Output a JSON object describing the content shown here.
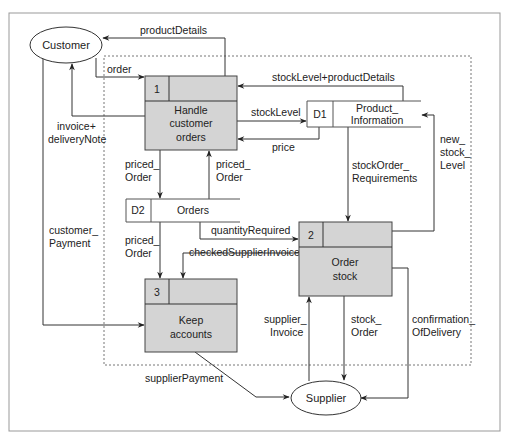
{
  "diagram": {
    "external_entities": [
      {
        "id": "customer",
        "label": "Customer"
      },
      {
        "id": "supplier",
        "label": "Supplier"
      }
    ],
    "processes": [
      {
        "id": "1",
        "number": "1",
        "label_lines": [
          "Handle",
          "customer",
          "orders"
        ]
      },
      {
        "id": "2",
        "number": "2",
        "label_lines": [
          "Order",
          "stock"
        ]
      },
      {
        "id": "3",
        "number": "3",
        "label_lines": [
          "Keep",
          "accounts"
        ]
      }
    ],
    "data_stores": [
      {
        "id": "D1",
        "code": "D1",
        "label_lines": [
          "Product_",
          "Information"
        ]
      },
      {
        "id": "D2",
        "code": "D2",
        "label_lines": [
          "Orders"
        ]
      }
    ],
    "flows": {
      "productDetails": {
        "lines": [
          "productDetails"
        ],
        "from": "1",
        "to": "customer"
      },
      "order": {
        "lines": [
          "order"
        ],
        "from": "customer",
        "to": "1"
      },
      "invoice_deliveryNote": {
        "lines": [
          "invoice+",
          "deliveryNote"
        ],
        "from": "1",
        "to": "customer"
      },
      "customer_Payment": {
        "lines": [
          "customer_",
          "Payment"
        ],
        "from": "customer",
        "to": "3"
      },
      "stockLevel_productDetails": {
        "lines": [
          "stockLevel+productDetails"
        ],
        "from": "D1",
        "to": "1"
      },
      "stockLevel": {
        "lines": [
          "stockLevel"
        ],
        "from": "1",
        "to": "D1"
      },
      "price": {
        "lines": [
          "price"
        ],
        "from": "D1",
        "to": "1"
      },
      "priced_Order_down": {
        "lines": [
          "priced_",
          "Order"
        ],
        "from": "1",
        "to": "D2"
      },
      "priced_Order_up": {
        "lines": [
          "priced_",
          "Order"
        ],
        "from": "D2",
        "to": "1"
      },
      "priced_Order_to3": {
        "lines": [
          "priced_",
          "Order"
        ],
        "from": "D2",
        "to": "3"
      },
      "stockOrder_Requirements": {
        "lines": [
          "stockOrder_",
          "Requirements"
        ],
        "from": "D1",
        "to": "2"
      },
      "new_stock_Level": {
        "lines": [
          "new_",
          "stock_",
          "Level"
        ],
        "from": "2",
        "to": "D1"
      },
      "quantityRequired": {
        "lines": [
          "quantityRequired"
        ],
        "from": "D2",
        "to": "2"
      },
      "checkedSupplierInvoice": {
        "lines": [
          "checkedSupplierInvoice"
        ],
        "from": "2",
        "to": "3"
      },
      "supplier_Invoice": {
        "lines": [
          "supplier_",
          "Invoice"
        ],
        "from": "supplier",
        "to": "2"
      },
      "stock_Order": {
        "lines": [
          "stock_",
          "Order"
        ],
        "from": "2",
        "to": "supplier"
      },
      "confirmation_OfDelivery": {
        "lines": [
          "confirmation_",
          "OfDelivery"
        ],
        "from": "2",
        "to": "supplier"
      },
      "supplierPayment": {
        "lines": [
          "supplierPayment"
        ],
        "from": "3",
        "to": "supplier"
      }
    },
    "colors": {
      "process_fill": "#d4d4d4",
      "line": "#333333",
      "boundary_dashed": "#777777",
      "frame": "#999999"
    }
  }
}
